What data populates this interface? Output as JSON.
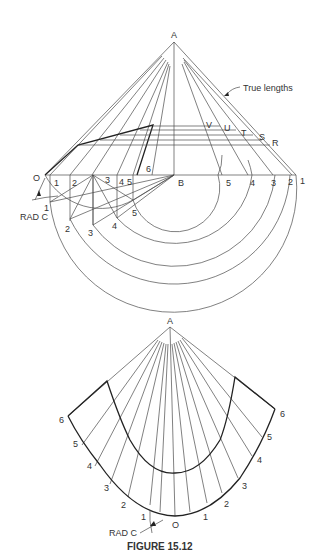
{
  "figure": {
    "caption": "FIGURE 15.12",
    "top_view": {
      "apex_label": "A",
      "origin_label": "O",
      "center_label": "B",
      "annotation": "True lengths",
      "radius_label": "RAD C",
      "true_length_points": [
        "V",
        "U",
        "T",
        "S",
        "R"
      ],
      "base_left_labels": [
        "1",
        "2",
        "3",
        "4",
        "5",
        "6"
      ],
      "base_right_labels": [
        "5",
        "4",
        "3",
        "2",
        "1"
      ],
      "arc_point_labels": [
        "1",
        "2",
        "3",
        "4",
        "5"
      ]
    },
    "development": {
      "apex_label": "A",
      "origin_label": "O",
      "radius_label": "RAD C",
      "left_labels": [
        "1",
        "2",
        "3",
        "4",
        "5",
        "6"
      ],
      "right_labels": [
        "1",
        "2",
        "3",
        "4",
        "5",
        "6"
      ]
    }
  }
}
